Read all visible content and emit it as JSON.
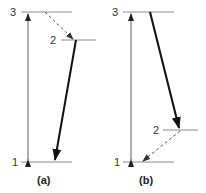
{
  "diagram": {
    "type": "energy-level-diagram",
    "panels": [
      {
        "caption": "(a)",
        "levels": [
          {
            "label": "3"
          },
          {
            "label": "2"
          },
          {
            "label": "1"
          }
        ],
        "transitions": [
          {
            "from": "1",
            "to": "3",
            "style": "thin-double-arrow",
            "meaning": "pump"
          },
          {
            "from": "3",
            "to": "2",
            "style": "dashed-arrow",
            "meaning": "non-radiative decay"
          },
          {
            "from": "2",
            "to": "1",
            "style": "thick-arrow",
            "meaning": "radiative transition"
          }
        ]
      },
      {
        "caption": "(b)",
        "levels": [
          {
            "label": "3"
          },
          {
            "label": "2"
          },
          {
            "label": "1"
          }
        ],
        "transitions": [
          {
            "from": "1",
            "to": "3",
            "style": "thin-double-arrow",
            "meaning": "pump"
          },
          {
            "from": "3",
            "to": "2",
            "style": "thick-arrow",
            "meaning": "radiative transition"
          },
          {
            "from": "2",
            "to": "1",
            "style": "dashed-arrow",
            "meaning": "non-radiative decay"
          }
        ]
      }
    ]
  },
  "colors": {
    "level_line": "#8a8a8a",
    "pump_arrow": "#6a6a6a",
    "radiative_arrow": "#111111",
    "dashed_arrow": "#555555"
  }
}
